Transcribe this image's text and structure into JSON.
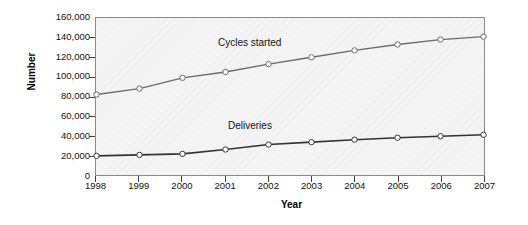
{
  "chart_data": {
    "type": "line",
    "title": "",
    "xlabel": "Year",
    "ylabel": "Number",
    "categories": [
      "1998",
      "1999",
      "2000",
      "2001",
      "2002",
      "2003",
      "2004",
      "2005",
      "2006",
      "2007"
    ],
    "x": [
      1998,
      1999,
      2000,
      2001,
      2002,
      2003,
      2004,
      2005,
      2006,
      2007
    ],
    "ylim": [
      0,
      160000
    ],
    "xlim": [
      1998,
      2007
    ],
    "y_ticks": [
      0,
      20000,
      40000,
      60000,
      80000,
      100000,
      120000,
      140000,
      160000
    ],
    "y_tick_labels": [
      "0",
      "20,000",
      "40,000",
      "60,000",
      "80,000",
      "100,000",
      "120,000",
      "140,000",
      "160,000"
    ],
    "grid": false,
    "legend": "inline-annotations",
    "marker": "open-circle",
    "series": [
      {
        "name": "Cycles started",
        "color": "#6b6b6b",
        "values": [
          82000,
          88000,
          99000,
          105000,
          113000,
          120000,
          127000,
          133000,
          138000,
          141000
        ]
      },
      {
        "name": "Deliveries",
        "color": "#333333",
        "values": [
          19500,
          20500,
          21500,
          26000,
          31000,
          33500,
          36000,
          38000,
          39500,
          41000
        ]
      }
    ],
    "annotations": [
      {
        "text": "Cycles started",
        "series": "Cycles started"
      },
      {
        "text": "Deliveries",
        "series": "Deliveries"
      }
    ]
  },
  "colors": {
    "plot_background": "#f4f4f4",
    "plot_border": "#8a8a8a",
    "axis_text": "#111111",
    "cycles_line": "#6b6b6b",
    "deliveries_line": "#333333",
    "marker_fill": "#ffffff"
  }
}
